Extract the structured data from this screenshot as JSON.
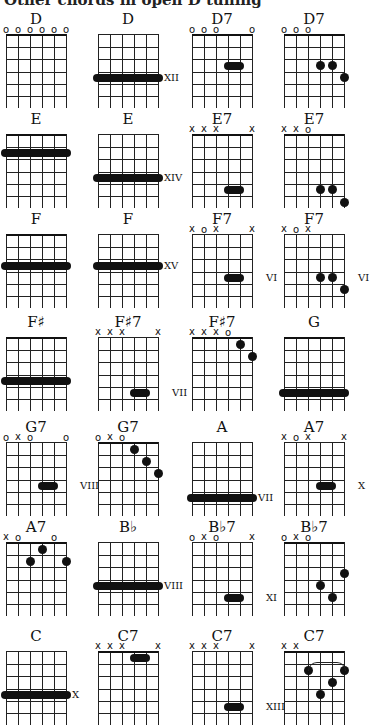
{
  "header": "Other chords in open D tuning",
  "chords": [
    {
      "name": "D",
      "x": 6,
      "y": 10,
      "nut": true,
      "marks": [
        "o",
        "o",
        "o",
        "o",
        "o",
        "o"
      ],
      "barres": [],
      "dots": [],
      "pos": ""
    },
    {
      "name": "D",
      "x": 98,
      "y": 10,
      "nut": false,
      "marks": [
        "",
        "",
        "",
        "",
        "",
        ""
      ],
      "barres": [
        {
          "fret": 3.5,
          "from": 0,
          "to": 5
        }
      ],
      "dots": [],
      "pos": "XII",
      "posFret": 3.5
    },
    {
      "name": "D7",
      "x": 192,
      "y": 10,
      "nut": true,
      "marks": [
        "o",
        "o",
        "o",
        "",
        "",
        "o"
      ],
      "barres": [
        {
          "fret": 2.5,
          "from": 3,
          "to": 4
        }
      ],
      "dots": [],
      "pos": ""
    },
    {
      "name": "D7",
      "x": 284,
      "y": 10,
      "nut": true,
      "marks": [
        "o",
        "o",
        "o",
        "",
        "",
        ""
      ],
      "barres": [],
      "dots": [
        {
          "s": 3,
          "f": 2.5
        },
        {
          "s": 4,
          "f": 2.5
        },
        {
          "s": 5,
          "f": 3.5
        }
      ],
      "pos": ""
    },
    {
      "name": "E",
      "x": 6,
      "y": 110,
      "nut": true,
      "marks": [
        "",
        "",
        "",
        "",
        "",
        ""
      ],
      "barres": [
        {
          "fret": 1.5,
          "from": 0,
          "to": 5
        }
      ],
      "dots": [],
      "pos": ""
    },
    {
      "name": "E",
      "x": 98,
      "y": 110,
      "nut": false,
      "marks": [
        "",
        "",
        "",
        "",
        "",
        ""
      ],
      "barres": [
        {
          "fret": 3.5,
          "from": 0,
          "to": 5
        }
      ],
      "dots": [],
      "pos": "XIV",
      "posFret": 3.5
    },
    {
      "name": "E7",
      "x": 192,
      "y": 110,
      "nut": true,
      "marks": [
        "x",
        "x",
        "x",
        "",
        "",
        "x"
      ],
      "barres": [
        {
          "fret": 4.5,
          "from": 3,
          "to": 4
        }
      ],
      "dots": [],
      "pos": ""
    },
    {
      "name": "E7",
      "x": 284,
      "y": 110,
      "nut": true,
      "marks": [
        "x",
        "x",
        "o",
        "",
        "",
        ""
      ],
      "barres": [],
      "dots": [
        {
          "s": 3,
          "f": 4.5
        },
        {
          "s": 4,
          "f": 4.5
        },
        {
          "s": 5,
          "f": 5.5
        }
      ],
      "pos": ""
    },
    {
      "name": "F",
      "x": 6,
      "y": 210,
      "nut": true,
      "marks": [
        "",
        "",
        "",
        "",
        "",
        ""
      ],
      "barres": [
        {
          "fret": 2.5,
          "from": 0,
          "to": 5
        }
      ],
      "dots": [],
      "pos": ""
    },
    {
      "name": "F",
      "x": 98,
      "y": 210,
      "nut": false,
      "marks": [
        "",
        "",
        "",
        "",
        "",
        ""
      ],
      "barres": [
        {
          "fret": 2.5,
          "from": 0,
          "to": 5
        }
      ],
      "dots": [],
      "pos": "XV",
      "posFret": 2.5
    },
    {
      "name": "F7",
      "x": 192,
      "y": 210,
      "nut": false,
      "marks": [
        "x",
        "o",
        "x",
        "",
        "",
        "x"
      ],
      "barres": [
        {
          "fret": 3.5,
          "from": 3,
          "to": 4
        }
      ],
      "dots": [],
      "pos": "VI",
      "posFret": 3.5
    },
    {
      "name": "F7",
      "x": 284,
      "y": 210,
      "nut": false,
      "marks": [
        "x",
        "o",
        "x",
        "",
        "",
        ""
      ],
      "barres": [],
      "dots": [
        {
          "s": 3,
          "f": 3.5
        },
        {
          "s": 4,
          "f": 3.5
        },
        {
          "s": 5,
          "f": 4.5
        }
      ],
      "pos": "VI",
      "posFret": 3.5
    },
    {
      "name": "F♯",
      "x": 6,
      "y": 313,
      "nut": true,
      "marks": [
        "",
        "",
        "",
        "",
        "",
        ""
      ],
      "barres": [
        {
          "fret": 3.5,
          "from": 0,
          "to": 5
        }
      ],
      "dots": [],
      "pos": ""
    },
    {
      "name": "F♯7",
      "x": 98,
      "y": 313,
      "nut": false,
      "marks": [
        "x",
        "x",
        "x",
        "",
        "",
        "x"
      ],
      "barres": [
        {
          "fret": 4.5,
          "from": 3,
          "to": 4
        }
      ],
      "dots": [],
      "pos": "VII",
      "posFret": 4.5
    },
    {
      "name": "F♯7",
      "x": 192,
      "y": 313,
      "nut": true,
      "marks": [
        "x",
        "x",
        "x",
        "o",
        "",
        ""
      ],
      "barres": [],
      "dots": [
        {
          "s": 4,
          "f": 0.5
        },
        {
          "s": 5,
          "f": 1.5
        }
      ],
      "pos": ""
    },
    {
      "name": "G",
      "x": 284,
      "y": 313,
      "nut": true,
      "marks": [
        "",
        "",
        "",
        "",
        "",
        ""
      ],
      "barres": [
        {
          "fret": 4.5,
          "from": 0,
          "to": 5
        }
      ],
      "dots": [],
      "pos": ""
    },
    {
      "name": "G7",
      "x": 6,
      "y": 418,
      "nut": false,
      "marks": [
        "o",
        "x",
        "o",
        "",
        "",
        "o"
      ],
      "barres": [
        {
          "fret": 3.5,
          "from": 3,
          "to": 4
        }
      ],
      "dots": [],
      "pos": "VIII",
      "posFret": 3.5
    },
    {
      "name": "G7",
      "x": 98,
      "y": 418,
      "nut": true,
      "marks": [
        "o",
        "x",
        "o",
        "",
        "",
        ""
      ],
      "barres": [],
      "dots": [
        {
          "s": 3,
          "f": 0.5
        },
        {
          "s": 4,
          "f": 1.5
        },
        {
          "s": 5,
          "f": 2.5
        }
      ],
      "pos": ""
    },
    {
      "name": "A",
      "x": 192,
      "y": 418,
      "nut": false,
      "marks": [
        "",
        "",
        "",
        "",
        "",
        ""
      ],
      "barres": [
        {
          "fret": 4.5,
          "from": 0,
          "to": 5
        }
      ],
      "dots": [],
      "pos": "VII",
      "posFret": 4.5
    },
    {
      "name": "A7",
      "x": 284,
      "y": 418,
      "nut": false,
      "marks": [
        "x",
        "o",
        "x",
        "",
        "",
        "x"
      ],
      "barres": [
        {
          "fret": 3.5,
          "from": 3,
          "to": 4
        }
      ],
      "dots": [],
      "pos": "X",
      "posFret": 3.5
    },
    {
      "name": "A7",
      "x": 6,
      "y": 518,
      "nut": true,
      "marks": [
        "x",
        "o",
        "",
        "",
        "o",
        ""
      ],
      "barres": [],
      "dots": [
        {
          "s": 3,
          "f": 0.5
        },
        {
          "s": 2,
          "f": 1.5
        },
        {
          "s": 5,
          "f": 1.5
        }
      ],
      "pos": ""
    },
    {
      "name": "B♭",
      "x": 98,
      "y": 518,
      "nut": false,
      "marks": [
        "",
        "",
        "",
        "",
        "",
        ""
      ],
      "barres": [
        {
          "fret": 3.5,
          "from": 0,
          "to": 5
        }
      ],
      "dots": [],
      "pos": "VIII",
      "posFret": 3.5
    },
    {
      "name": "B♭7",
      "x": 192,
      "y": 518,
      "nut": false,
      "marks": [
        "o",
        "x",
        "o",
        "",
        "",
        "x"
      ],
      "barres": [
        {
          "fret": 4.5,
          "from": 3,
          "to": 4
        }
      ],
      "dots": [],
      "pos": "XI",
      "posFret": 4.5
    },
    {
      "name": "B♭7",
      "x": 284,
      "y": 518,
      "nut": true,
      "marks": [
        "o",
        "x",
        "o",
        "",
        "",
        ""
      ],
      "barres": [],
      "dots": [
        {
          "s": 5,
          "f": 2.5
        },
        {
          "s": 3,
          "f": 3.5
        },
        {
          "s": 4,
          "f": 4.5
        }
      ],
      "pos": ""
    },
    {
      "name": "C",
      "x": 6,
      "y": 627,
      "nut": false,
      "marks": [
        "",
        "",
        "",
        "",
        "",
        ""
      ],
      "barres": [
        {
          "fret": 3.5,
          "from": 0,
          "to": 5
        }
      ],
      "dots": [],
      "pos": "X",
      "posFret": 3.5
    },
    {
      "name": "C7",
      "x": 98,
      "y": 627,
      "nut": true,
      "marks": [
        "x",
        "x",
        "x",
        "",
        "",
        "x"
      ],
      "barres": [
        {
          "fret": 0.5,
          "from": 3,
          "to": 4
        }
      ],
      "dots": [],
      "pos": ""
    },
    {
      "name": "C7",
      "x": 192,
      "y": 627,
      "nut": false,
      "marks": [
        "x",
        "x",
        "x",
        "",
        "",
        "x"
      ],
      "barres": [
        {
          "fret": 4.5,
          "from": 3,
          "to": 4
        }
      ],
      "dots": [],
      "pos": "XIII",
      "posFret": 4.5
    },
    {
      "name": "C7",
      "x": 284,
      "y": 627,
      "nut": true,
      "marks": [
        "x",
        "x",
        "",
        "",
        "",
        ""
      ],
      "barres": [],
      "dots": [
        {
          "s": 2,
          "f": 1.5
        },
        {
          "s": 5,
          "f": 1.5
        },
        {
          "s": 4,
          "f": 2.5
        },
        {
          "s": 3,
          "f": 3.5
        }
      ],
      "arc": {
        "from": 2,
        "to": 5,
        "fret": 0.9
      },
      "pos": ""
    }
  ]
}
